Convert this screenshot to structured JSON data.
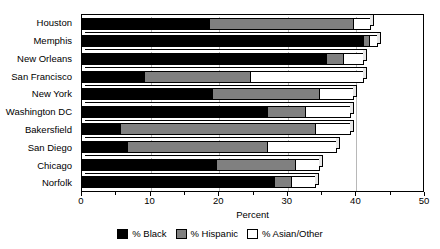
{
  "chart_data": {
    "type": "bar",
    "orientation": "horizontal",
    "stacked": true,
    "title": "",
    "xlabel": "Percent",
    "ylabel": "",
    "xlim": [
      0,
      50
    ],
    "xticks": [
      0,
      10,
      20,
      30,
      40,
      50
    ],
    "xticklabels": [
      "0",
      "10",
      "20",
      "30",
      "40",
      "50"
    ],
    "grid": true,
    "legend_position": "bottom",
    "categories": [
      "Houston",
      "Memphis",
      "New Orleans",
      "San Francisco",
      "New York",
      "Washington DC",
      "Bakersfield",
      "San Diego",
      "Chicago",
      "Norfolk"
    ],
    "series": [
      {
        "name": "% Black",
        "color": "#000000",
        "values": [
          18.5,
          41.0,
          35.5,
          9.0,
          19.0,
          27.0,
          5.5,
          6.5,
          19.5,
          28.0
        ]
      },
      {
        "name": "% Hispanic",
        "color": "#808080",
        "values": [
          21.0,
          0.8,
          2.5,
          15.5,
          15.5,
          5.5,
          28.5,
          20.5,
          11.5,
          2.5
        ]
      },
      {
        "name": "% Asian/Other",
        "color": "#FFFFFF",
        "values": [
          2.5,
          1.2,
          3.0,
          16.5,
          5.0,
          6.5,
          5.0,
          10.0,
          3.5,
          3.5
        ]
      }
    ],
    "totals": [
      42.0,
      43.0,
      41.0,
      41.0,
      39.5,
      39.0,
      39.0,
      37.0,
      34.5,
      34.0
    ]
  },
  "legend": {
    "items": [
      {
        "label": "% Black",
        "swatch": "black"
      },
      {
        "label": "% Hispanic",
        "swatch": "gray"
      },
      {
        "label": "% Asian/Other",
        "swatch": "white"
      }
    ]
  },
  "axis": {
    "x_title": "Percent"
  }
}
